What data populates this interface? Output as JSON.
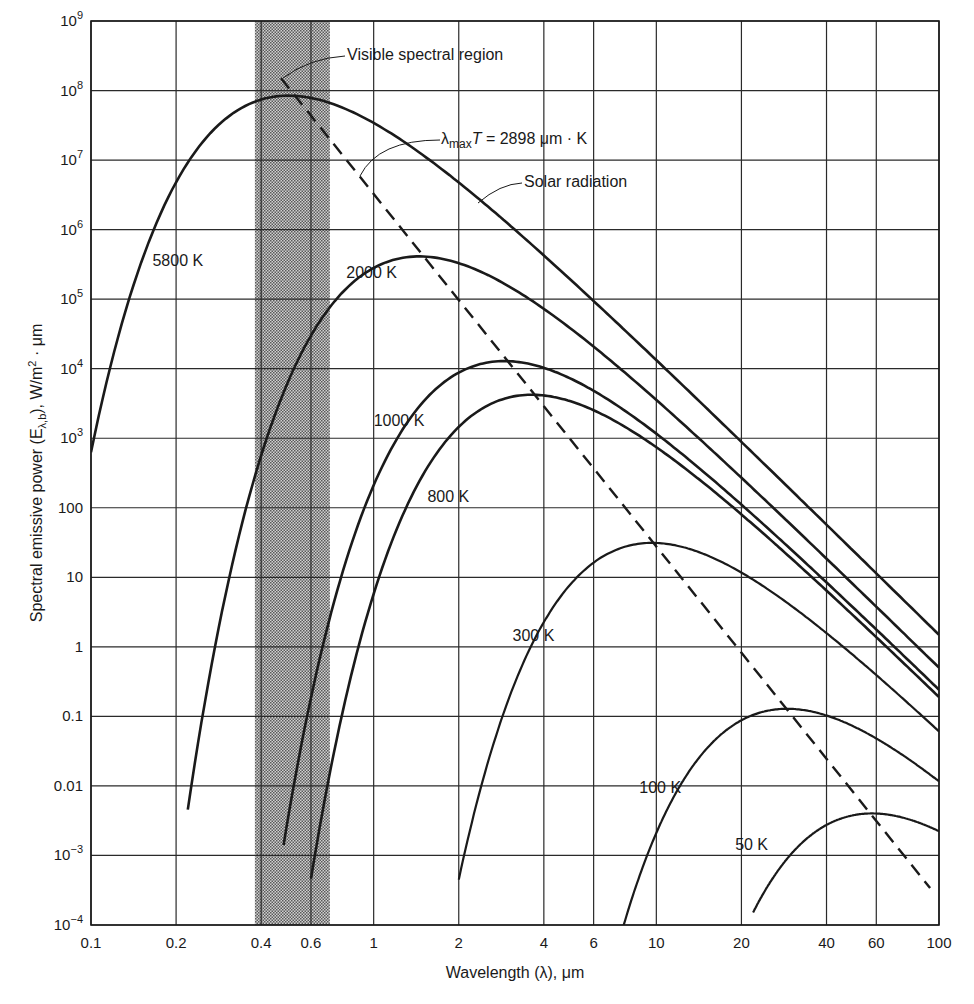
{
  "chart_data": {
    "type": "line",
    "title": "",
    "xlabel": "Wavelength (λ), μm",
    "ylabel": "Spectral emissive power (Eλ,b), W/m² · μm",
    "xscale": "log",
    "yscale": "log",
    "xlim": [
      0.1,
      100
    ],
    "ylim": [
      0.0001,
      1000000000
    ],
    "grid": true,
    "x_ticks": [
      {
        "v": 0.1,
        "label": "0.1"
      },
      {
        "v": 0.2,
        "label": "0.2"
      },
      {
        "v": 0.4,
        "label": "0.4"
      },
      {
        "v": 0.6,
        "label": "0.6"
      },
      {
        "v": 1,
        "label": "1"
      },
      {
        "v": 2,
        "label": "2"
      },
      {
        "v": 4,
        "label": "4"
      },
      {
        "v": 6,
        "label": "6"
      },
      {
        "v": 10,
        "label": "10"
      },
      {
        "v": 20,
        "label": "20"
      },
      {
        "v": 40,
        "label": "40"
      },
      {
        "v": 60,
        "label": "60"
      },
      {
        "v": 100,
        "label": "100"
      }
    ],
    "y_ticks": [
      {
        "v": 1000000000.0,
        "base": "10",
        "exp": "9"
      },
      {
        "v": 100000000.0,
        "base": "10",
        "exp": "8"
      },
      {
        "v": 10000000.0,
        "base": "10",
        "exp": "7"
      },
      {
        "v": 1000000.0,
        "base": "10",
        "exp": "6"
      },
      {
        "v": 100000.0,
        "base": "10",
        "exp": "5"
      },
      {
        "v": 10000.0,
        "base": "10",
        "exp": "4"
      },
      {
        "v": 1000.0,
        "base": "10",
        "exp": "3"
      },
      {
        "v": 100,
        "base": "100",
        "exp": ""
      },
      {
        "v": 10,
        "base": "10",
        "exp": ""
      },
      {
        "v": 1,
        "base": "1",
        "exp": ""
      },
      {
        "v": 0.1,
        "base": "0.1",
        "exp": ""
      },
      {
        "v": 0.01,
        "base": "0.01",
        "exp": ""
      },
      {
        "v": 0.001,
        "base": "10",
        "exp": "−3"
      },
      {
        "v": 0.0001,
        "base": "10",
        "exp": "−4"
      }
    ],
    "visible_band": {
      "from": 0.38,
      "to": 0.7,
      "label": "Visible spectral region"
    },
    "series": [
      {
        "name": "5800 K",
        "T": 5800,
        "range": [
          0.1,
          100
        ],
        "label_at": [
          0.165,
          300000.0
        ],
        "x": [
          0.1,
          0.15,
          0.2,
          0.3,
          0.4,
          0.5,
          0.6,
          0.8,
          1,
          2,
          4,
          10,
          20,
          40,
          100
        ],
        "y": [
          780.0,
          320000.0,
          3300000.0,
          32000000.0,
          69000000.0,
          84000000.0,
          76000000.0,
          49000000.0,
          30000000.0,
          3400000.0,
          260000.0,
          7400.0,
          480.0,
          31.0,
          0.81
        ]
      },
      {
        "name": "Solar radiation",
        "T": 5800,
        "annotation": true
      },
      {
        "name": "2000 K",
        "T": 2000,
        "range": [
          0.22,
          100
        ],
        "label_at": [
          0.8,
          200000.0
        ],
        "x": [
          0.22,
          0.3,
          0.4,
          0.6,
          1,
          1.45,
          2,
          4,
          10,
          20,
          40,
          100
        ],
        "y": [
          0.00023,
          6.5,
          1200.0,
          60000.0,
          280000.0,
          370000.0,
          290000.0,
          64000.0,
          2500.0,
          160.0,
          10.0,
          0.28
        ]
      },
      {
        "name": "1000 K",
        "T": 1000,
        "range": [
          0.48,
          100
        ],
        "label_at": [
          1.0,
          1500.0
        ],
        "x": [
          0.48,
          0.6,
          1,
          2,
          2.9,
          4,
          10,
          20,
          40,
          100
        ],
        "y": [
          0.00022,
          0.083,
          210.0,
          8700.0,
          12000.0,
          9000.0,
          1100.0,
          80.0,
          5.1,
          0.14
        ]
      },
      {
        "name": "800 K",
        "T": 800,
        "range": [
          0.6,
          100
        ],
        "label_at": [
          1.55,
          120
        ],
        "x": [
          0.6,
          0.8,
          1,
          2,
          3.6,
          4,
          10,
          20,
          40,
          100
        ],
        "y": [
          0.0002,
          0.31,
          51.0,
          3800.0,
          4000.0,
          3900.0,
          630.0,
          57.0,
          3.9,
          0.11
        ]
      },
      {
        "name": "300 K",
        "T": 300,
        "range": [
          2,
          100
        ],
        "label_at": [
          3.1,
          1.2
        ],
        "x": [
          2,
          3,
          4,
          6,
          9.7,
          15,
          20,
          40,
          100
        ],
        "y": [
          0.00021,
          0.59,
          5.7,
          19.0,
          31.0,
          25.0,
          18.0,
          4.7,
          0.29
        ]
      },
      {
        "name": "100 K",
        "T": 100,
        "range": [
          7.5,
          100
        ],
        "label_at": [
          8.7,
          0.008
        ],
        "x": [
          7.5,
          10,
          15,
          20,
          29,
          40,
          60,
          100
        ],
        "y": [
          0.00016,
          0.0031,
          0.038,
          0.079,
          0.1,
          0.086,
          0.049,
          0.017
        ]
      },
      {
        "name": "50 K",
        "T": 50,
        "range": [
          22,
          100
        ],
        "label_at": [
          19,
          0.0012
        ],
        "x": [
          22,
          30,
          40,
          58,
          80,
          100
        ],
        "y": [
          0.0001,
          0.00097,
          0.0023,
          0.0032,
          0.0028,
          0.0021
        ]
      }
    ],
    "wien_line": {
      "name": "λmax T = 2898 μm · K",
      "constant": 2898,
      "style": "dashed",
      "x": [
        0.47,
        93
      ],
      "y": [
        150000000.0,
        0.00034
      ]
    }
  },
  "annotations": {
    "visible": "Visible spectral region",
    "wien_prefix": "λ",
    "wien_sub": "max",
    "wien_T": "T",
    "wien_rest": " = 2898 μm · K",
    "solar": "Solar radiation"
  },
  "axes": {
    "xlabel": "Wavelength (λ), μm",
    "ylabel_a": "Spectral emissive power (E",
    "ylabel_sub": "λ,b",
    "ylabel_b": "), W/m",
    "ylabel_sup": "2",
    "ylabel_c": " · μm"
  },
  "colors": {
    "ink": "#1a1a1a",
    "band": "#9a9a9a",
    "grid": "#2a2a2a"
  }
}
